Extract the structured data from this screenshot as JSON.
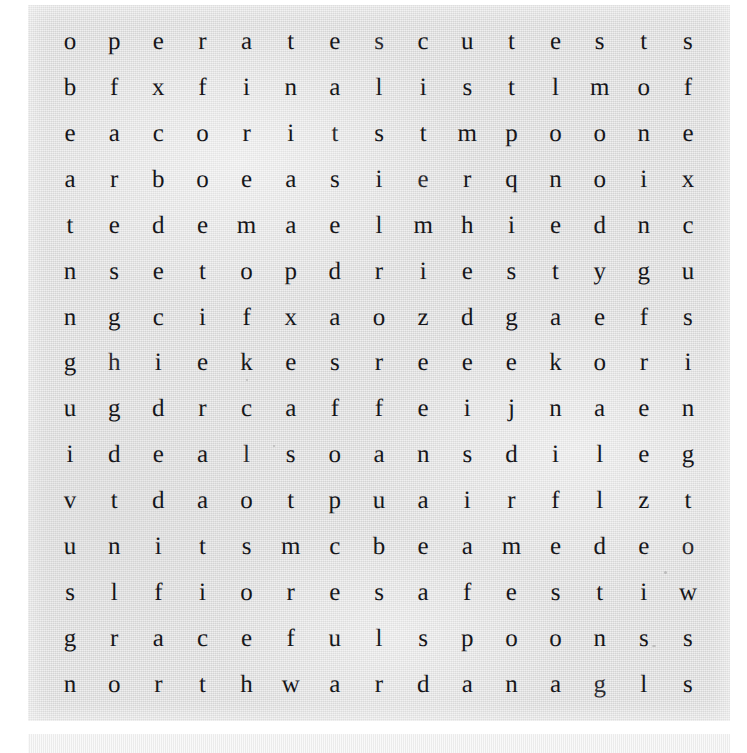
{
  "document": {
    "kind": "word-search-puzzle",
    "title": "",
    "rows": 15,
    "columns": 15,
    "background_color": "#e2e2e2",
    "page_color": "#ffffff",
    "letter_color": "#16161a"
  },
  "grid": {
    "rows": [
      [
        "o",
        "p",
        "e",
        "r",
        "a",
        "t",
        "e",
        "s",
        "c",
        "u",
        "t",
        "e",
        "s",
        "t",
        "s"
      ],
      [
        "b",
        "f",
        "x",
        "f",
        "i",
        "n",
        "a",
        "l",
        "i",
        "s",
        "t",
        "l",
        "m",
        "o",
        "f"
      ],
      [
        "e",
        "a",
        "c",
        "o",
        "r",
        "i",
        "t",
        "s",
        "t",
        "m",
        "p",
        "o",
        "o",
        "n",
        "e"
      ],
      [
        "a",
        "r",
        "b",
        "o",
        "e",
        "a",
        "s",
        "i",
        "e",
        "r",
        "q",
        "n",
        "o",
        "i",
        "x"
      ],
      [
        "t",
        "e",
        "d",
        "e",
        "m",
        "a",
        "e",
        "l",
        "m",
        "h",
        "i",
        "e",
        "d",
        "n",
        "c"
      ],
      [
        "n",
        "s",
        "e",
        "t",
        "o",
        "p",
        "d",
        "r",
        "i",
        "e",
        "s",
        "t",
        "y",
        "g",
        "u"
      ],
      [
        "n",
        "g",
        "c",
        "i",
        "f",
        "x",
        "a",
        "o",
        "z",
        "d",
        "g",
        "a",
        "e",
        "f",
        "s"
      ],
      [
        "g",
        "h",
        "i",
        "e",
        "k",
        "e",
        "s",
        "r",
        "e",
        "e",
        "e",
        "k",
        "o",
        "r",
        "i"
      ],
      [
        "u",
        "g",
        "d",
        "r",
        "c",
        "a",
        "f",
        "f",
        "e",
        "i",
        "j",
        "n",
        "a",
        "e",
        "n"
      ],
      [
        "i",
        "d",
        "e",
        "a",
        "l",
        "s",
        "o",
        "a",
        "n",
        "s",
        "d",
        "i",
        "l",
        "e",
        "g"
      ],
      [
        "v",
        "t",
        "d",
        "a",
        "o",
        "t",
        "p",
        "u",
        "a",
        "i",
        "r",
        "f",
        "l",
        "z",
        "t"
      ],
      [
        "u",
        "n",
        "i",
        "t",
        "s",
        "m",
        "c",
        "b",
        "e",
        "a",
        "m",
        "e",
        "d",
        "e",
        "o"
      ],
      [
        "s",
        "l",
        "f",
        "i",
        "o",
        "r",
        "e",
        "s",
        "a",
        "f",
        "e",
        "s",
        "t",
        "i",
        "w"
      ],
      [
        "g",
        "r",
        "a",
        "c",
        "e",
        "f",
        "u",
        "l",
        "s",
        "p",
        "o",
        "o",
        "n",
        "s",
        "s"
      ],
      [
        "n",
        "o",
        "r",
        "t",
        "h",
        "w",
        "a",
        "r",
        "d",
        "a",
        "n",
        "a",
        "g",
        "l",
        "s"
      ]
    ],
    "row_strings": [
      "operatescutests",
      "bfxfinalistlmof",
      "eacoritstmpoone",
      "arboeasierqnoix",
      "tedemaelmhiednc",
      "nsetopdriestygu",
      "ngcifxaozdgaefs",
      "ghiekesreeekori",
      "ugdrcaffeijnaen",
      "idealsoansdileg",
      "vtdaotpuairflzt",
      "unitsmcbeamedeo",
      "slfioresafestiw",
      "gracefulspoonss",
      "northwardanagls"
    ],
    "column_strings": [
      "obeatnngui vusgn",
      "pfareseghdtnlro",
      "excdeecidedfiar",
      "rfoeetiearaitct",
      "airemofkcloseeh",
      "ttiaapxeafstmrw",
      "estsedaserporea",
      "slsileorafpuefr",
      "citeminieanecud",
      "ustrheedsiiaasa",
      "ttpqisgedjrmefn",
      "elonetakniflseo",
      "smoodyeoaldldna",
      "toniengrieezeig",
      "sfexcusingtowss"
    ]
  }
}
